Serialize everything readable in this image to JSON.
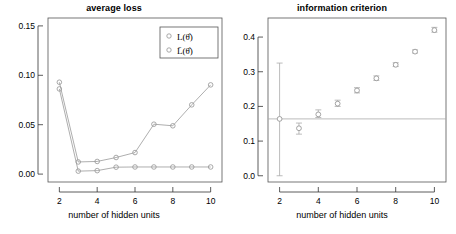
{
  "figure": {
    "width": 456,
    "height": 234,
    "background": "#ffffff"
  },
  "chart_data": [
    {
      "type": "line",
      "panel": "left",
      "title": "average loss",
      "xlabel": "number of hidden units",
      "ylabel": "",
      "x": [
        2,
        3,
        4,
        5,
        6,
        7,
        8,
        9,
        10
      ],
      "xlim": [
        1.4,
        10.6
      ],
      "ylim": [
        -0.008,
        0.158
      ],
      "xticks": [
        2,
        4,
        6,
        8,
        10
      ],
      "xticklabels": [
        "2",
        "4",
        "6",
        "8",
        "10"
      ],
      "yticks": [
        0.0,
        0.05,
        0.1,
        0.15
      ],
      "yticklabels": [
        "0.00",
        "0.05",
        "0.10",
        "0.15"
      ],
      "grid": false,
      "marker": "open-circle",
      "series": [
        {
          "name": "L(θ̂)",
          "legend_label": "L(θ̂)",
          "color": "#999999",
          "values": [
            0.093,
            0.0123,
            0.0128,
            0.0168,
            0.0218,
            0.0505,
            0.0489,
            0.0701,
            0.0903
          ]
        },
        {
          "name": "L̄(θ̂)",
          "legend_label": "L̄(θ̂)",
          "color": "#999999",
          "values": [
            0.0862,
            0.003,
            0.0035,
            0.007,
            0.0072,
            0.0072,
            0.0072,
            0.0072,
            0.0072
          ]
        }
      ],
      "legend": {
        "position": "top-right",
        "entries": [
          "L(θ̂)",
          "L̄(θ̂)"
        ],
        "marker": "open-circle"
      }
    },
    {
      "type": "scatter",
      "panel": "right",
      "title": "information criterion",
      "xlabel": "number of hidden units",
      "ylabel": "",
      "x": [
        2,
        3,
        4,
        5,
        6,
        7,
        8,
        9,
        10
      ],
      "xlim": [
        1.4,
        10.6
      ],
      "ylim": [
        -0.018,
        0.455
      ],
      "xticks": [
        2,
        4,
        6,
        8,
        10
      ],
      "xticklabels": [
        "2",
        "4",
        "6",
        "8",
        "10"
      ],
      "yticks": [
        0.0,
        0.1,
        0.2,
        0.3,
        0.4
      ],
      "yticklabels": [
        "0.0",
        "0.1",
        "0.2",
        "0.3",
        "0.4"
      ],
      "grid": false,
      "marker": "open-circle",
      "values": [
        0.164,
        0.137,
        0.177,
        0.208,
        0.246,
        0.281,
        0.32,
        0.358,
        0.42
      ],
      "error_low": [
        0.0,
        0.12,
        0.168,
        0.2,
        0.239,
        0.275,
        0.315,
        0.354,
        0.414
      ],
      "error_high": [
        0.325,
        0.152,
        0.19,
        0.218,
        0.254,
        0.288,
        0.326,
        0.363,
        0.428
      ],
      "reference_line": {
        "orientation": "horizontal",
        "value": 0.164,
        "color": "#aaaaaa"
      },
      "point_color": "#999999",
      "errorbar_color": "#aaaaaa"
    }
  ]
}
